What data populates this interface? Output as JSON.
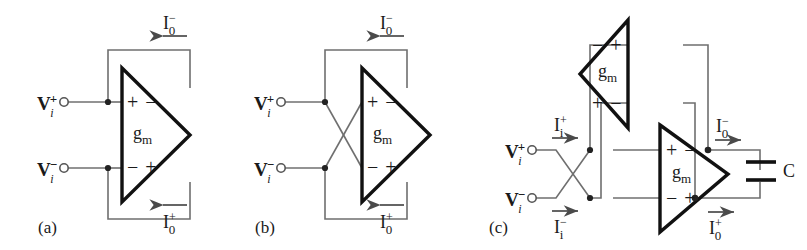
{
  "figure": {
    "caption_labels": [
      "(a)",
      "(b)",
      "(c)"
    ],
    "background": "#ffffff",
    "wire_color": "#6b6b6b",
    "device_color": "#000000"
  },
  "symbols": {
    "gm": "g",
    "gm_sub": "m",
    "cap": "C",
    "plus": "+",
    "minus": "−",
    "v": "V",
    "i_current": "I",
    "sub_i": "i",
    "sub_0": "0"
  },
  "panels": [
    {
      "id": "a",
      "label": "(a)",
      "amplifiers": [
        {
          "name": "ota-main",
          "gain_label": "g",
          "gain_sub": "m",
          "orientation": "right",
          "top_terminals": [
            "+",
            "−"
          ],
          "bottom_terminals": [
            "−",
            "+"
          ]
        }
      ],
      "inputs": [
        {
          "name": "v-in-plus",
          "base": "V",
          "sup": "+",
          "sub": "i"
        },
        {
          "name": "v-in-minus",
          "base": "V",
          "sup": "−",
          "sub": "i"
        }
      ],
      "currents": [
        {
          "name": "i-out-minus",
          "base": "I",
          "sup": "−",
          "sub": "0",
          "arrow": "left",
          "position": "top"
        },
        {
          "name": "i-out-plus",
          "base": "I",
          "sup": "+",
          "sub": "0",
          "arrow": "left",
          "position": "bottom"
        }
      ],
      "crossed_inputs": false
    },
    {
      "id": "b",
      "label": "(b)",
      "amplifiers": [
        {
          "name": "ota-main",
          "gain_label": "g",
          "gain_sub": "m",
          "orientation": "right",
          "top_terminals": [
            "+",
            "−"
          ],
          "bottom_terminals": [
            "−",
            "+"
          ]
        }
      ],
      "inputs": [
        {
          "name": "v-in-plus",
          "base": "V",
          "sup": "+",
          "sub": "i"
        },
        {
          "name": "v-in-minus",
          "base": "V",
          "sup": "−",
          "sub": "i"
        }
      ],
      "currents": [
        {
          "name": "i-out-minus",
          "base": "I",
          "sup": "−",
          "sub": "0",
          "arrow": "left",
          "position": "top"
        },
        {
          "name": "i-out-plus",
          "base": "I",
          "sup": "+",
          "sub": "0",
          "arrow": "left",
          "position": "bottom"
        }
      ],
      "crossed_inputs": true
    },
    {
      "id": "c",
      "label": "(c)",
      "amplifiers": [
        {
          "name": "ota-upper",
          "gain_label": "g",
          "gain_sub": "m",
          "orientation": "left",
          "top_terminals": [
            "−",
            "+"
          ],
          "bottom_terminals": [
            "+",
            "−"
          ]
        },
        {
          "name": "ota-lower",
          "gain_label": "g",
          "gain_sub": "m",
          "orientation": "right",
          "top_terminals": [
            "+",
            "−"
          ],
          "bottom_terminals": [
            "−",
            "+"
          ]
        }
      ],
      "inputs": [
        {
          "name": "v-in-plus",
          "base": "V",
          "sup": "+",
          "sub": "i"
        },
        {
          "name": "v-in-minus",
          "base": "V",
          "sup": "−",
          "sub": "i"
        }
      ],
      "currents": [
        {
          "name": "i-in-plus",
          "base": "I",
          "sup": "+",
          "sub": "i",
          "arrow": "right",
          "position": "top-left"
        },
        {
          "name": "i-in-minus",
          "base": "I",
          "sup": "−",
          "sub": "i",
          "arrow": "right",
          "position": "bottom-left"
        },
        {
          "name": "i-out-minus",
          "base": "I",
          "sup": "−",
          "sub": "0",
          "arrow": "right",
          "position": "top-right"
        },
        {
          "name": "i-out-plus",
          "base": "I",
          "sup": "+",
          "sub": "0",
          "arrow": "right",
          "position": "bottom-right"
        }
      ],
      "components": [
        {
          "name": "capacitor",
          "label": "C",
          "type": "capacitor"
        }
      ],
      "crossed_inputs": true
    }
  ]
}
